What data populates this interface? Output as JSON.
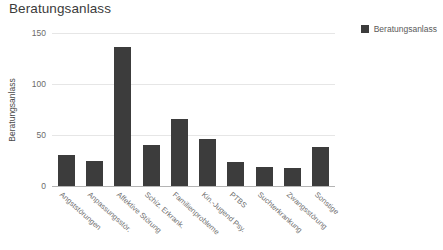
{
  "chart_data": {
    "type": "bar",
    "title": "Beratungsanlass",
    "xlabel": "",
    "ylabel": "Beratungsanlass",
    "ylim": [
      0,
      150
    ],
    "yticks": [
      0,
      50,
      100,
      150
    ],
    "grid": true,
    "legend_position": "top-right",
    "bar_color": "#3c3c3c",
    "categories": [
      "Angststörungen",
      "Anpassungsstör.",
      "Affektive Störung",
      "Schiz. Erkrank.",
      "Familienprobleme",
      "Kin.-Jugend Psy.",
      "PTBS",
      "Suchterkrankung",
      "Zwangsstörung",
      "Sonstige"
    ],
    "values": [
      30,
      25,
      136,
      40,
      66,
      46,
      24,
      19,
      18,
      38
    ],
    "series": [
      {
        "name": "Beratungsanlass",
        "values": [
          30,
          25,
          136,
          40,
          66,
          46,
          24,
          19,
          18,
          38
        ]
      }
    ],
    "legend": [
      "Beratungsanlass"
    ]
  }
}
